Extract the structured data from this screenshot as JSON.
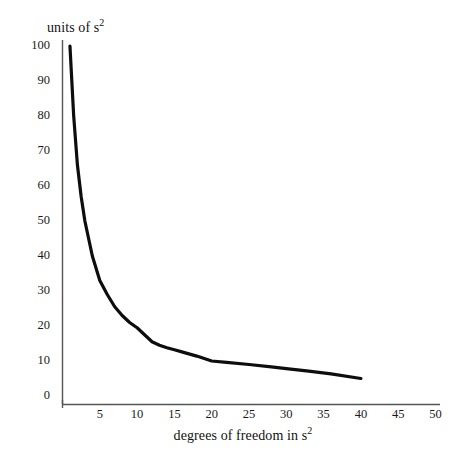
{
  "chart_data": {
    "type": "line",
    "title": "",
    "xlabel": "degrees of freedom in s2",
    "xlabel_base": "degrees of freedom in s",
    "xlabel_sup": "2",
    "ylabel": "units of s2",
    "ylabel_base": "units of s",
    "ylabel_sup": "2",
    "xlim": [
      0,
      50
    ],
    "ylim": [
      0,
      100
    ],
    "grid": false,
    "legend": "none",
    "line_color": "#0d0d0d",
    "axis_color": "#555555",
    "background_color": "#ffffff",
    "xticks": [
      5,
      10,
      15,
      20,
      25,
      30,
      35,
      40,
      45,
      50
    ],
    "xtick_labels": [
      "5",
      "10",
      "15",
      "20",
      "25",
      "30",
      "35",
      "40",
      "45",
      "50"
    ],
    "yticks": [
      0,
      10,
      20,
      30,
      40,
      50,
      60,
      70,
      80,
      90,
      100
    ],
    "ytick_labels": [
      "0",
      "10",
      "20",
      "30",
      "40",
      "50",
      "60",
      "70",
      "80",
      "90",
      "100"
    ],
    "series": [
      {
        "name": "variance of s2",
        "x": [
          1,
          1.5,
          2,
          2.5,
          3,
          4,
          5,
          6,
          7,
          8,
          9,
          10,
          11,
          12,
          13,
          14,
          15,
          16,
          18,
          20,
          22,
          25,
          28,
          30,
          33,
          36,
          40
        ],
        "y": [
          100,
          80,
          66,
          57,
          50,
          40,
          33,
          29,
          25.5,
          23,
          21,
          19.5,
          17.5,
          15.5,
          14.5,
          13.8,
          13.2,
          12.6,
          11.4,
          10,
          9.6,
          9,
          8.3,
          7.8,
          7.1,
          6.3,
          5
        ]
      }
    ]
  },
  "axes": {
    "y_axis_name": "value-axis",
    "x_axis_name": "degrees-of-freedom-axis"
  }
}
